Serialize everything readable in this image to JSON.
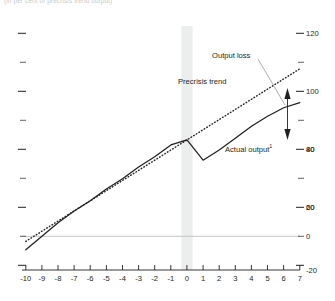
{
  "caption": "(in per cent of precrisis trend output)",
  "chart_data": {
    "type": "line",
    "title": "",
    "subtitle": "",
    "xlabel": "",
    "ylabel": "",
    "xlim": [
      -10,
      7
    ],
    "ylim": [
      -20,
      120
    ],
    "x_ticks": [
      -10,
      -9,
      -8,
      -7,
      -6,
      -5,
      -4,
      -3,
      -2,
      -1,
      0,
      1,
      2,
      3,
      4,
      5,
      6,
      7
    ],
    "x_tick_labels": [
      "-10",
      "-9",
      "-8",
      "-7",
      "-6",
      "-5",
      "-4",
      "-3",
      "-2",
      "-1",
      "0",
      "1",
      "2",
      "3",
      "4",
      "5",
      "6",
      "7"
    ],
    "y_ticks": [
      -20,
      0,
      20,
      40,
      60,
      80,
      100,
      120
    ],
    "y_tick_labels": [
      "-20",
      "0",
      "20",
      "40",
      "60",
      "80",
      "100",
      "120"
    ],
    "y_minor_ticks": [
      -10,
      10,
      30,
      50,
      70,
      90,
      110
    ],
    "grid": false,
    "zero_line": 0,
    "legend_position": "inline-annotation",
    "crisis_band": {
      "from": -0.35,
      "to": 0.35,
      "color": "#eceded"
    },
    "series": [
      {
        "name": "Precrisis trend",
        "style": "dotted",
        "color": "#231f20",
        "x": [
          -10,
          -9,
          -8,
          -7,
          -6,
          -5,
          -4,
          -3,
          -2,
          -1,
          0,
          1,
          2,
          3,
          4,
          5,
          6,
          7
        ],
        "values": [
          -3,
          3,
          9,
          15,
          21,
          27,
          33,
          39,
          45,
          51,
          57,
          63,
          69,
          75,
          81,
          87,
          93,
          99
        ]
      },
      {
        "name": "Actual output",
        "style": "solid",
        "color": "#231f20",
        "x": [
          -10,
          -9,
          -8,
          -7,
          -6,
          -5,
          -4,
          -3,
          -2,
          -1,
          0,
          1,
          2,
          3,
          4,
          5,
          6,
          7
        ],
        "values": [
          -8,
          0,
          8,
          15,
          21,
          28,
          34,
          41,
          47,
          54,
          57,
          45,
          51,
          58,
          65,
          71,
          76,
          79
        ]
      }
    ],
    "annotations": [
      {
        "name": "output-loss",
        "text": "Output loss",
        "x": 4.1,
        "y": 108
      },
      {
        "name": "precrisis-trend",
        "text": "Precrisis trend",
        "x": 0.2,
        "y": 92
      },
      {
        "name": "actual-output",
        "text": "Actual output",
        "superscript": "1",
        "x": 3.3,
        "y": 60
      }
    ]
  },
  "annotations": {
    "output_loss": "Output loss",
    "precrisis_trend": "Precrisis trend",
    "actual_output": "Actual output",
    "actual_output_footnote": "1"
  }
}
